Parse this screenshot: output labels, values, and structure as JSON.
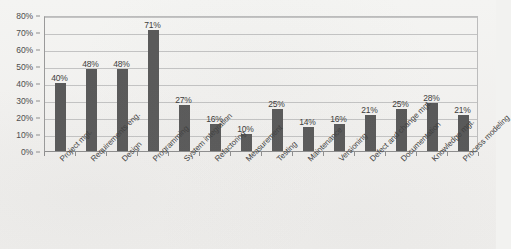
{
  "chart_data": {
    "type": "bar",
    "title": "",
    "subtitle": "",
    "xlabel": "",
    "ylabel": "",
    "ylim": [
      0,
      80
    ],
    "grid": true,
    "legend": false,
    "legend_position": "none",
    "orientation": "vertical",
    "bar_color": "#595959",
    "value_label_suffix": "%",
    "y_tick_labels": [
      "0%",
      "10%",
      "20%",
      "30%",
      "40%",
      "50%",
      "60%",
      "70%",
      "80%"
    ],
    "y_ticks": [
      0,
      10,
      20,
      30,
      40,
      50,
      60,
      70,
      80
    ],
    "categories": [
      "Project mgt.",
      "Requirements eng.",
      "Design",
      "Programming",
      "System integration",
      "Refactoring",
      "Measurement",
      "Testing",
      "Maintenance",
      "Versioning",
      "Defect and change mgt.",
      "Documentation",
      "Knowledge mgt.",
      "Process modeling"
    ],
    "values": [
      40,
      48,
      48,
      71,
      27,
      16,
      10,
      25,
      14,
      16,
      21,
      25,
      28,
      21
    ],
    "value_labels": [
      "40%",
      "48%",
      "48%",
      "71%",
      "27%",
      "16%",
      "10%",
      "25%",
      "14%",
      "16%",
      "21%",
      "25%",
      "28%",
      "21%"
    ]
  },
  "colors": {
    "bar": "#595959",
    "gridline": "#c3c3c3",
    "axis": "#8e8e8e",
    "text": "#3f3f3f",
    "background": "#f2f2f0"
  }
}
